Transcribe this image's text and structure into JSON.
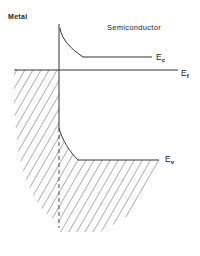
{
  "diagram": {
    "type": "band-diagram",
    "regions": {
      "metal": "Metal",
      "semiconductor": "Semiconductor"
    },
    "levels": {
      "conduction_band": {
        "symbol": "E",
        "subscript": "c"
      },
      "fermi_level": {
        "symbol": "E",
        "subscript": "f"
      },
      "valence_band": {
        "symbol": "E",
        "subscript": "v"
      }
    },
    "colors": {
      "line": "#333333",
      "hatch": "#555555",
      "background": "#ffffff"
    }
  }
}
